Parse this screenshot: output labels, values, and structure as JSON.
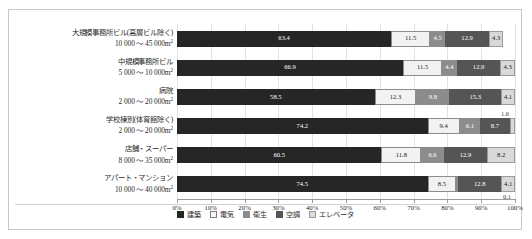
{
  "chart_data": {
    "type": "bar",
    "orientation": "horizontal",
    "stacked": true,
    "normalized_percent": true,
    "title": "",
    "xlabel": "",
    "ylabel": "",
    "xlim": [
      0,
      100
    ],
    "grid": true,
    "legend_position": "bottom",
    "x_tick_labels": [
      "0%",
      "10%",
      "20%",
      "30%",
      "40%",
      "50%",
      "60%",
      "70%",
      "80%",
      "90%",
      "100%"
    ],
    "x_tick_values": [
      0,
      10,
      20,
      30,
      40,
      50,
      60,
      70,
      80,
      90,
      100
    ],
    "categories": [
      {
        "line1": "大規模事務所ビル(高層ビル除く)",
        "line2": "10 000 ～ 45 000m",
        "unit_sup": "2"
      },
      {
        "line1": "中規模事務所ビル",
        "line2": "5 000 ～ 10 000m",
        "unit_sup": "2"
      },
      {
        "line1": "病院",
        "line2": "2 000 ～ 20 000m",
        "unit_sup": "2"
      },
      {
        "line1": "学校棟別(体育館除く)",
        "line2": "2 000 ～ 20 000m",
        "unit_sup": "2"
      },
      {
        "line1": "店舗・スーパー",
        "line2": "8 000 ～ 35 000m",
        "unit_sup": "2"
      },
      {
        "line1": "アパート・マンション",
        "line2": "10 000 ～ 40 000m",
        "unit_sup": "2"
      }
    ],
    "series": [
      {
        "name": "建築",
        "key": "kenchiku",
        "color": "#262626",
        "values": [
          63.4,
          66.9,
          58.5,
          74.2,
          60.5,
          74.5
        ]
      },
      {
        "name": "電気",
        "key": "denki",
        "color": "#f2f2f2",
        "values": [
          11.5,
          11.5,
          12.3,
          9.4,
          11.8,
          8.5
        ]
      },
      {
        "name": "衛生",
        "key": "eisei",
        "color": "#8c8c8c",
        "values": [
          4.5,
          4.4,
          9.8,
          6.1,
          6.6,
          0.1
        ]
      },
      {
        "name": "空調",
        "key": "kucho",
        "color": "#555555",
        "values": [
          12.9,
          12.9,
          15.3,
          8.7,
          12.9,
          12.8
        ]
      },
      {
        "name": "エレベータ",
        "key": "elevator",
        "color": "#d9d9d9",
        "values": [
          4.3,
          4.3,
          4.1,
          1.6,
          8.2,
          4.1
        ]
      }
    ],
    "outside_labels": [
      {
        "row": 3,
        "series": "エレベータ",
        "text": "1.6"
      },
      {
        "row": 5,
        "series": "衛生",
        "text": "0.1"
      }
    ]
  },
  "legend": {
    "items": [
      {
        "label": "建築",
        "swatch_class": "lg-kenchiku"
      },
      {
        "label": "電気",
        "swatch_class": "lg-denki"
      },
      {
        "label": "衛生",
        "swatch_class": "lg-eisei"
      },
      {
        "label": "空調",
        "swatch_class": "lg-kucho"
      },
      {
        "label": "エレベータ",
        "swatch_class": "lg-elevator"
      }
    ]
  }
}
